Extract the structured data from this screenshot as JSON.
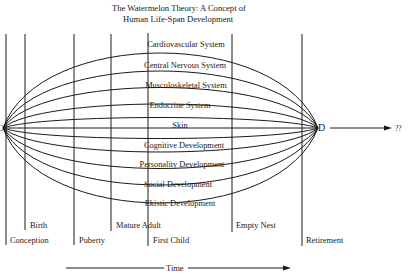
{
  "title": {
    "line1": "The Watermelon Theory:  A Concept of",
    "line2": "Human Life-Span Development"
  },
  "bands": [
    "Cardiovascular System",
    "Central Nervous System",
    "Musculoskeletal System",
    "Endocrine System",
    "Skin",
    "Cognitive Development",
    "Personality Development",
    "Social Development",
    "Ekistic Development"
  ],
  "endpoints": {
    "left_label": "C",
    "right_label": "D",
    "beyond_label": "??"
  },
  "stages": [
    {
      "label": "Conception",
      "x": 6
    },
    {
      "label": "Birth",
      "x": 25
    },
    {
      "label": "Puberty",
      "x": 74
    },
    {
      "label": "Mature Adult",
      "x": 111
    },
    {
      "label": "First Child",
      "x": 148
    },
    {
      "label": "Empty Nest",
      "x": 232
    },
    {
      "label": "Retirement",
      "x": 302
    }
  ],
  "axis": {
    "label": "Time"
  },
  "colors": {
    "ink": "#1a1a1a",
    "background": "#ffffff"
  }
}
